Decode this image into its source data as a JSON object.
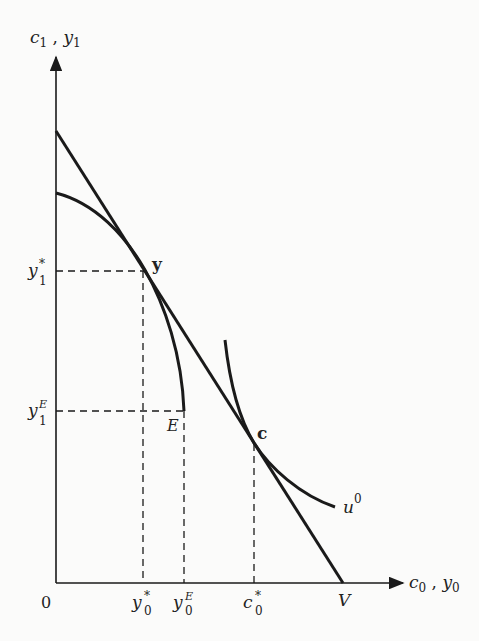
{
  "diagram": {
    "axes": {
      "y_label": "c₁ , y₁",
      "y_label_main": "c",
      "y_label_sub": "1",
      "y_label_sep": " , ",
      "y_label_main2": "y",
      "y_label_sub2": "1",
      "x_label_main": "c",
      "x_label_sub": "0",
      "x_label_sep": " , ",
      "x_label_main2": "y",
      "x_label_sub2": "0",
      "origin": "0"
    },
    "x_ticks": [
      {
        "main": "y",
        "sup": "*",
        "sub": "0"
      },
      {
        "main": "y",
        "sup": "E",
        "sub": "0"
      },
      {
        "main": "c",
        "sup": "*",
        "sub": "0"
      },
      {
        "main": "V",
        "sup": "",
        "sub": ""
      }
    ],
    "y_ticks": [
      {
        "main": "y",
        "sup": "*",
        "sub": "1"
      },
      {
        "main": "y",
        "sup": "E",
        "sub": "1"
      }
    ],
    "points": {
      "production": "y",
      "consumption": "c",
      "endowment": "E"
    },
    "curves": {
      "indifference": {
        "main": "u",
        "sup": "0"
      },
      "market_line": "wealth line ending at V",
      "production_frontier": "production opportunity curve ending at E"
    },
    "colors": {
      "ink": "#1a1a1a",
      "background": "#fbfbfa"
    }
  }
}
